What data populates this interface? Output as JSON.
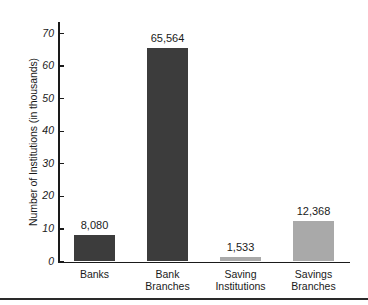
{
  "chart_data": {
    "type": "bar",
    "title": "",
    "subtitle": "",
    "xlabel": "",
    "ylabel": "Number of Institutions (in thousands)",
    "categories": [
      "Banks",
      "Bank Branches",
      "Saving Institutions",
      "Savings Branches"
    ],
    "category_lines": [
      [
        "Banks"
      ],
      [
        "Bank",
        "Branches"
      ],
      [
        "Saving",
        "Institutions"
      ],
      [
        "Savings",
        "Branches"
      ]
    ],
    "values": [
      8.08,
      65.564,
      1.533,
      12.368
    ],
    "data_labels": [
      "8,080",
      "65,564",
      "1,533",
      "12,368"
    ],
    "bar_colors": [
      "#3c3c3c",
      "#3c3c3c",
      "#a9a9a9",
      "#a9a9a9"
    ],
    "ylim": [
      0,
      74
    ],
    "yticks": [
      0,
      10,
      20,
      30,
      40,
      50,
      60,
      70
    ],
    "ytick_labels": [
      "0",
      "10",
      "20",
      "30",
      "40",
      "50",
      "60",
      "70"
    ],
    "grid": false,
    "legend": "none",
    "axis_color": "#1a1a1a",
    "background_color": "#ffffff"
  },
  "bars": [
    {
      "label": "Banks",
      "value_text": "8,080",
      "value": 8.08,
      "color": "#3c3c3c",
      "line1": "Banks",
      "line2": ""
    },
    {
      "label": "Bank Branches",
      "value_text": "65,564",
      "value": 65.564,
      "color": "#3c3c3c",
      "line1": "Bank",
      "line2": "Branches"
    },
    {
      "label": "Saving Institutions",
      "value_text": "1,533",
      "value": 1.533,
      "color": "#a9a9a9",
      "line1": "Saving",
      "line2": "Institutions"
    },
    {
      "label": "Savings Branches",
      "value_text": "12,368",
      "value": 12.368,
      "color": "#a9a9a9",
      "line1": "Savings",
      "line2": "Branches"
    }
  ],
  "axis": {
    "y_title": "Number of Institutions (in thousands)",
    "ticks": [
      "70",
      "60",
      "50",
      "40",
      "30",
      "20",
      "10",
      "0"
    ]
  }
}
